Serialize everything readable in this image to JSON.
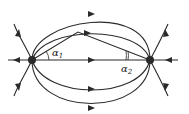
{
  "diagram": {
    "colors": {
      "line": "#2a2a2a",
      "charge": "#111111",
      "background": "#ffffff"
    },
    "charges": [
      {
        "name": "left-charge",
        "x": 32,
        "y": 60
      },
      {
        "name": "right-charge",
        "x": 150,
        "y": 60
      }
    ],
    "labels": {
      "alpha1": "α",
      "alpha1_sub": "1",
      "alpha2": "α",
      "alpha2_sub": "2"
    },
    "apex": {
      "x": 78,
      "y": 32
    }
  }
}
